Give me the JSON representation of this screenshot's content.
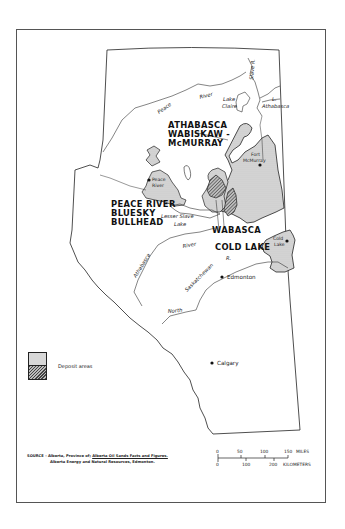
{
  "map": {
    "regions": [
      {
        "id": "athabasca",
        "lines": [
          "ATHABASCA",
          "WABISKAW -",
          "McMURRAY"
        ]
      },
      {
        "id": "peace_river",
        "lines": [
          "PEACE RIVER",
          "BLUESKY",
          "BULLHEAD"
        ]
      },
      {
        "id": "wabasca",
        "lines": [
          "WABASCA"
        ]
      },
      {
        "id": "cold_lake",
        "lines": [
          "COLD LAKE"
        ]
      }
    ],
    "water": {
      "peace": "Peace",
      "river1": "River",
      "slave": "Slave R.",
      "lake_claire_1": "Lake",
      "lake_claire_2": "Claire",
      "l_athabasca_1": "L.",
      "l_athabasca_2": "Athabasca",
      "lesser_slave_1": "Lesser Slave",
      "lesser_slave_2": "Lake",
      "athabasca_river": "Athabasca",
      "river2": "River",
      "saskatchewan": "Saskatchewan",
      "saskatchewan_r": "R.",
      "north": "North"
    },
    "cities": {
      "fort_mcmurray_1": "Fort",
      "fort_mcmurray_2": "McMurray",
      "peace_river_1": "Peace",
      "peace_river_2": "River",
      "cold_lake_1": "Cold",
      "cold_lake_2": "Lake",
      "edmonton": "Edmonton",
      "calgary": "Calgary"
    }
  },
  "legend": {
    "label": "Deposit areas",
    "colors": {
      "light": "#d8d8d8",
      "dark_hatch": "#444444"
    }
  },
  "source": {
    "prefix": "SOURCE - Alberta, Province of; ",
    "title": "Alberta Oil Sands Facts and Figures.",
    "line2": "Alberta Energy and Natural Resources, Edmonton."
  },
  "scale": {
    "miles_ticks": [
      "0",
      "50",
      "100",
      "150"
    ],
    "miles_unit": "MILES",
    "km_ticks": [
      "0",
      "100",
      "200"
    ],
    "km_unit": "KILOMETERS"
  }
}
